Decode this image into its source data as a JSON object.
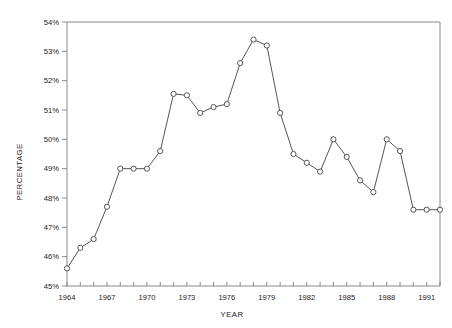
{
  "chart_data": {
    "type": "line",
    "title": "",
    "xlabel": "YEAR",
    "ylabel": "PERCENTAGE",
    "xlim": [
      1964,
      1992
    ],
    "ylim": [
      45,
      54
    ],
    "ytick_step": 1,
    "ytick_labels": [
      "45%",
      "46%",
      "47%",
      "48%",
      "49%",
      "50%",
      "51%",
      "52%",
      "53%",
      "54%"
    ],
    "ytick_values": [
      45,
      46,
      47,
      48,
      49,
      50,
      51,
      52,
      53,
      54
    ],
    "xtick_values": [
      1964,
      1965,
      1966,
      1967,
      1968,
      1969,
      1970,
      1971,
      1972,
      1973,
      1974,
      1975,
      1976,
      1977,
      1978,
      1979,
      1980,
      1981,
      1982,
      1983,
      1984,
      1985,
      1986,
      1987,
      1988,
      1989,
      1990,
      1991,
      1992
    ],
    "xtick_labels_shown": [
      "1964",
      "1967",
      "1970",
      "1973",
      "1976",
      "1979",
      "1982",
      "1985",
      "1988",
      "1991"
    ],
    "xtick_label_values": [
      1964,
      1967,
      1970,
      1973,
      1976,
      1979,
      1982,
      1985,
      1988,
      1991
    ],
    "grid": false,
    "legend": null,
    "marker": "open-circle",
    "line_color": "#555555",
    "marker_color": "#555555",
    "axis_color": "#888888",
    "x": [
      1964,
      1965,
      1966,
      1967,
      1968,
      1969,
      1970,
      1971,
      1972,
      1973,
      1974,
      1975,
      1976,
      1977,
      1978,
      1979,
      1980,
      1981,
      1982,
      1983,
      1984,
      1985,
      1986,
      1987,
      1988,
      1989,
      1990,
      1991,
      1992
    ],
    "values": [
      45.6,
      46.3,
      46.6,
      47.7,
      49.0,
      49.0,
      49.0,
      49.6,
      51.55,
      51.5,
      50.9,
      51.1,
      51.2,
      52.6,
      53.4,
      53.2,
      50.9,
      49.5,
      49.2,
      48.9,
      50.0,
      49.4,
      48.6,
      48.2,
      50.0,
      49.6,
      47.6,
      47.6,
      47.6
    ],
    "series": [
      {
        "name": "percentage",
        "values": [
          45.6,
          46.3,
          46.6,
          47.7,
          49.0,
          49.0,
          49.0,
          49.6,
          51.55,
          51.5,
          50.9,
          51.1,
          51.2,
          52.6,
          53.4,
          53.2,
          50.9,
          49.5,
          49.2,
          48.9,
          50.0,
          49.4,
          48.6,
          48.2,
          50.0,
          49.6,
          47.6,
          47.6,
          47.6
        ]
      }
    ]
  }
}
